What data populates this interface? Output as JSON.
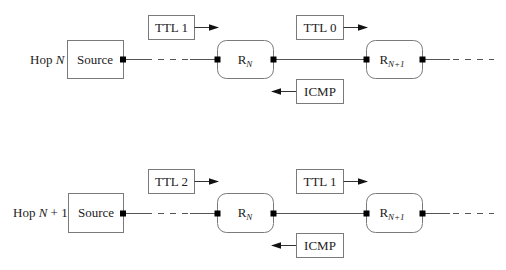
{
  "diagram": {
    "type": "traceroute hop sequence",
    "rows": [
      {
        "hop_label_prefix": "Hop ",
        "hop_label_var": "N",
        "hop_label_suffix": "",
        "source_label": "Source",
        "router_a": {
          "base": "R",
          "sub": "N"
        },
        "router_b": {
          "base": "R",
          "sub": "N+1"
        },
        "packet_to_a": "TTL 1",
        "packet_to_b": "TTL 0",
        "reply": "ICMP"
      },
      {
        "hop_label_prefix": "Hop ",
        "hop_label_var": "N",
        "hop_label_suffix": " + 1",
        "source_label": "Source",
        "router_a": {
          "base": "R",
          "sub": "N"
        },
        "router_b": {
          "base": "R",
          "sub": "N+1"
        },
        "packet_to_a": "TTL 2",
        "packet_to_b": "TTL 1",
        "reply": "ICMP"
      }
    ],
    "colors": {
      "box_stroke": "#7a7a7a",
      "line": "#555555",
      "port": "#000000",
      "text": "#222222"
    }
  }
}
